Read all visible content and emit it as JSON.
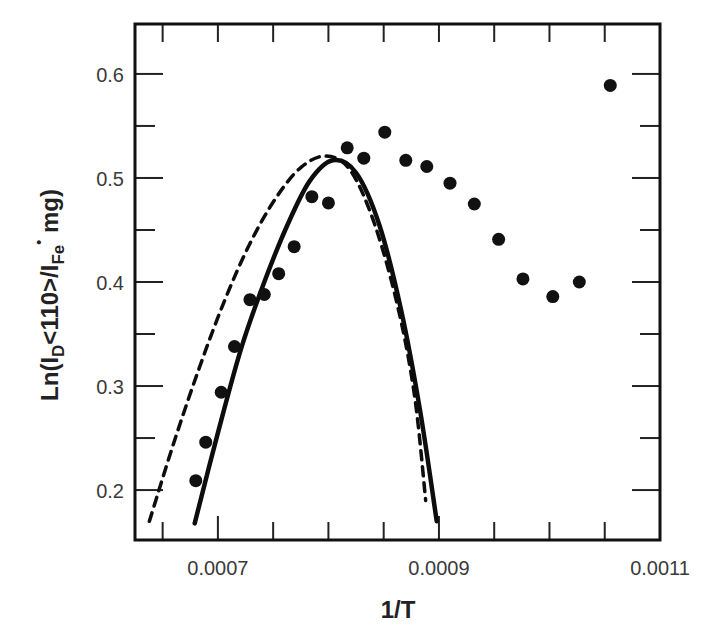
{
  "chart_data": {
    "type": "scatter",
    "title": "",
    "xlabel": "1/T",
    "ylabel": {
      "prefix": "Ln(I",
      "sub1": "D",
      "middle": "<110>/I",
      "sub2": "Fe",
      "dot": "•",
      "suffix": " mg)"
    },
    "xlim": [
      0.000625,
      0.0011
    ],
    "ylim": [
      0.152,
      0.648
    ],
    "grid": false,
    "legend": null,
    "x_ticks": [
      0.00065,
      0.0007,
      0.00075,
      0.0008,
      0.00085,
      0.0009,
      0.00095,
      0.001,
      0.00105
    ],
    "x_tick_labels": [
      {
        "value": 0.0007,
        "label": "0.0007"
      },
      {
        "value": 0.0009,
        "label": "0.0009"
      },
      {
        "value": 0.0011,
        "label": "0.0011"
      }
    ],
    "y_ticks": [
      0.2,
      0.25,
      0.3,
      0.35,
      0.4,
      0.45,
      0.5,
      0.55,
      0.6
    ],
    "y_tick_labels": [
      {
        "value": 0.2,
        "label": "0.2"
      },
      {
        "value": 0.3,
        "label": "0.3"
      },
      {
        "value": 0.4,
        "label": "0.4"
      },
      {
        "value": 0.5,
        "label": "0.5"
      },
      {
        "value": 0.6,
        "label": "0.6"
      }
    ],
    "series": [
      {
        "name": "data points",
        "type": "scatter",
        "x": [
          0.00068,
          0.000689,
          0.000703,
          0.000715,
          0.000729,
          0.000742,
          0.000755,
          0.000769,
          0.000785,
          0.0008,
          0.000817,
          0.000832,
          0.000851,
          0.00087,
          0.000889,
          0.00091,
          0.000932,
          0.000954,
          0.000976,
          0.001003,
          0.001027,
          0.001055
        ],
        "y": [
          0.209,
          0.246,
          0.294,
          0.338,
          0.383,
          0.388,
          0.408,
          0.434,
          0.482,
          0.476,
          0.529,
          0.519,
          0.544,
          0.517,
          0.511,
          0.495,
          0.475,
          0.441,
          0.403,
          0.386,
          0.4,
          0.589
        ]
      },
      {
        "name": "solid fit curve",
        "type": "line",
        "style": "solid",
        "x": [
          0.000679,
          0.0007,
          0.000721,
          0.000742,
          0.000763,
          0.000783,
          0.000804,
          0.000825,
          0.000846,
          0.000866,
          0.000883,
          0.000898
        ],
        "y": [
          0.168,
          0.255,
          0.336,
          0.4,
          0.455,
          0.497,
          0.517,
          0.505,
          0.455,
          0.372,
          0.276,
          0.17
        ]
      },
      {
        "name": "dashed fit curve",
        "type": "line",
        "style": "dashed",
        "x": [
          0.000638,
          0.00066,
          0.000683,
          0.000706,
          0.000729,
          0.000752,
          0.000775,
          0.000798,
          0.00082,
          0.000842,
          0.000863,
          0.000878,
          0.000888
        ],
        "y": [
          0.17,
          0.245,
          0.317,
          0.382,
          0.437,
          0.48,
          0.51,
          0.521,
          0.507,
          0.455,
          0.375,
          0.29,
          0.19
        ]
      }
    ]
  }
}
